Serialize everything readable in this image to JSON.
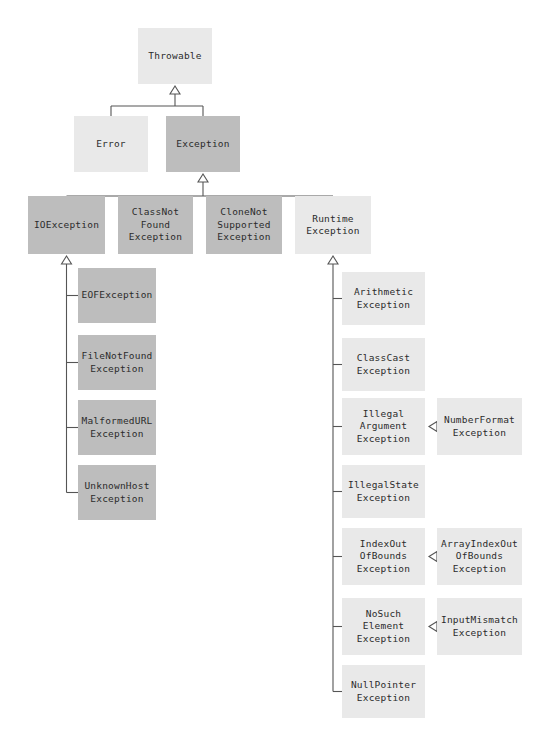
{
  "diagram": {
    "type": "uml-class-hierarchy",
    "palette": {
      "background": "#ffffff",
      "node_light": "#e9e9e9",
      "node_dark": "#bdbdbd",
      "line": "#555555",
      "text": "#2b2b2b"
    },
    "nodes": [
      {
        "id": "throwable",
        "label": "Throwable",
        "shade": "light",
        "x": 138,
        "y": 28,
        "w": 74,
        "h": 56
      },
      {
        "id": "error",
        "label": "Error",
        "shade": "light",
        "x": 74,
        "y": 116,
        "w": 74,
        "h": 56
      },
      {
        "id": "exception",
        "label": "Exception",
        "shade": "dark",
        "x": 166,
        "y": 116,
        "w": 74,
        "h": 56
      },
      {
        "id": "ioexception",
        "label": "IOException",
        "shade": "dark",
        "x": 28,
        "y": 196,
        "w": 77,
        "h": 58
      },
      {
        "id": "classnotfound",
        "label": "ClassNot\nFound\nException",
        "shade": "dark",
        "x": 118,
        "y": 196,
        "w": 75,
        "h": 58
      },
      {
        "id": "clonenotsupported",
        "label": "CloneNot\nSupported\nException",
        "shade": "dark",
        "x": 206,
        "y": 196,
        "w": 76,
        "h": 58
      },
      {
        "id": "runtimeexception",
        "label": "Runtime\nException",
        "shade": "light",
        "x": 295,
        "y": 196,
        "w": 76,
        "h": 58
      },
      {
        "id": "eofexception",
        "label": "EOFException",
        "shade": "dark",
        "x": 78,
        "y": 268,
        "w": 78,
        "h": 55
      },
      {
        "id": "filenotfound",
        "label": "FileNotFound\nException",
        "shade": "dark",
        "x": 78,
        "y": 335,
        "w": 78,
        "h": 55
      },
      {
        "id": "malformedurl",
        "label": "MalformedURL\nException",
        "shade": "dark",
        "x": 78,
        "y": 400,
        "w": 78,
        "h": 55
      },
      {
        "id": "unknownhost",
        "label": "UnknownHost\nException",
        "shade": "dark",
        "x": 78,
        "y": 465,
        "w": 78,
        "h": 55
      },
      {
        "id": "arithmetic",
        "label": "Arithmetic\nException",
        "shade": "light",
        "x": 342,
        "y": 272,
        "w": 83,
        "h": 53
      },
      {
        "id": "classcast",
        "label": "ClassCast\nException",
        "shade": "light",
        "x": 342,
        "y": 338,
        "w": 83,
        "h": 53
      },
      {
        "id": "illegalargument",
        "label": "Illegal\nArgument\nException",
        "shade": "light",
        "x": 342,
        "y": 398,
        "w": 83,
        "h": 57
      },
      {
        "id": "numberformat",
        "label": "NumberFormat\nException",
        "shade": "light",
        "x": 437,
        "y": 398,
        "w": 85,
        "h": 57
      },
      {
        "id": "illegalstate",
        "label": "IllegalState\nException",
        "shade": "light",
        "x": 342,
        "y": 465,
        "w": 83,
        "h": 53
      },
      {
        "id": "indexoutofbounds",
        "label": "IndexOut\nOfBounds\nException",
        "shade": "light",
        "x": 342,
        "y": 528,
        "w": 83,
        "h": 57
      },
      {
        "id": "arrayindexoutofbounds",
        "label": "ArrayIndexOut\nOfBounds\nException",
        "shade": "light",
        "x": 437,
        "y": 528,
        "w": 85,
        "h": 57
      },
      {
        "id": "nosuchelement",
        "label": "NoSuch\nElement\nException",
        "shade": "light",
        "x": 342,
        "y": 598,
        "w": 83,
        "h": 57
      },
      {
        "id": "inputmismatch",
        "label": "InputMismatch\nException",
        "shade": "light",
        "x": 437,
        "y": 598,
        "w": 85,
        "h": 57
      },
      {
        "id": "nullpointer",
        "label": "NullPointer\nException",
        "shade": "light",
        "x": 342,
        "y": 665,
        "w": 83,
        "h": 53
      }
    ],
    "edges": [
      {
        "from": "error",
        "to": "throwable",
        "kind": "generalization"
      },
      {
        "from": "exception",
        "to": "throwable",
        "kind": "generalization"
      },
      {
        "from": "ioexception",
        "to": "exception",
        "kind": "generalization"
      },
      {
        "from": "classnotfound",
        "to": "exception",
        "kind": "generalization"
      },
      {
        "from": "clonenotsupported",
        "to": "exception",
        "kind": "generalization"
      },
      {
        "from": "runtimeexception",
        "to": "exception",
        "kind": "generalization"
      },
      {
        "from": "eofexception",
        "to": "ioexception",
        "kind": "generalization"
      },
      {
        "from": "filenotfound",
        "to": "ioexception",
        "kind": "generalization"
      },
      {
        "from": "malformedurl",
        "to": "ioexception",
        "kind": "generalization"
      },
      {
        "from": "unknownhost",
        "to": "ioexception",
        "kind": "generalization"
      },
      {
        "from": "arithmetic",
        "to": "runtimeexception",
        "kind": "generalization"
      },
      {
        "from": "classcast",
        "to": "runtimeexception",
        "kind": "generalization"
      },
      {
        "from": "illegalargument",
        "to": "runtimeexception",
        "kind": "generalization"
      },
      {
        "from": "illegalstate",
        "to": "runtimeexception",
        "kind": "generalization"
      },
      {
        "from": "indexoutofbounds",
        "to": "runtimeexception",
        "kind": "generalization"
      },
      {
        "from": "nosuchelement",
        "to": "runtimeexception",
        "kind": "generalization"
      },
      {
        "from": "nullpointer",
        "to": "runtimeexception",
        "kind": "generalization"
      },
      {
        "from": "numberformat",
        "to": "illegalargument",
        "kind": "generalization-horizontal"
      },
      {
        "from": "arrayindexoutofbounds",
        "to": "indexoutofbounds",
        "kind": "generalization-horizontal"
      },
      {
        "from": "inputmismatch",
        "to": "nosuchelement",
        "kind": "generalization-horizontal"
      }
    ]
  }
}
